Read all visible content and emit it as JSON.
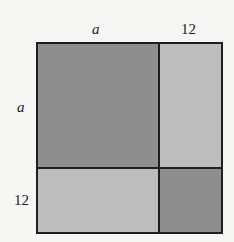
{
  "diagram": {
    "top_labels": {
      "left": "a",
      "right": "12"
    },
    "side_labels": {
      "top": "a",
      "bottom": "12"
    },
    "regions": [
      {
        "name": "a-by-a",
        "position": "top-left",
        "shade": "dark"
      },
      {
        "name": "12-by-a",
        "position": "top-right",
        "shade": "light"
      },
      {
        "name": "a-by-12",
        "position": "bottom-left",
        "shade": "light"
      },
      {
        "name": "12-by-12",
        "position": "bottom-right",
        "shade": "dark"
      }
    ],
    "colors": {
      "dark_fill": "#8e8e8e",
      "light_fill": "#bdbdbd",
      "border": "#1e1e1e",
      "background": "#f6f6f4"
    }
  }
}
